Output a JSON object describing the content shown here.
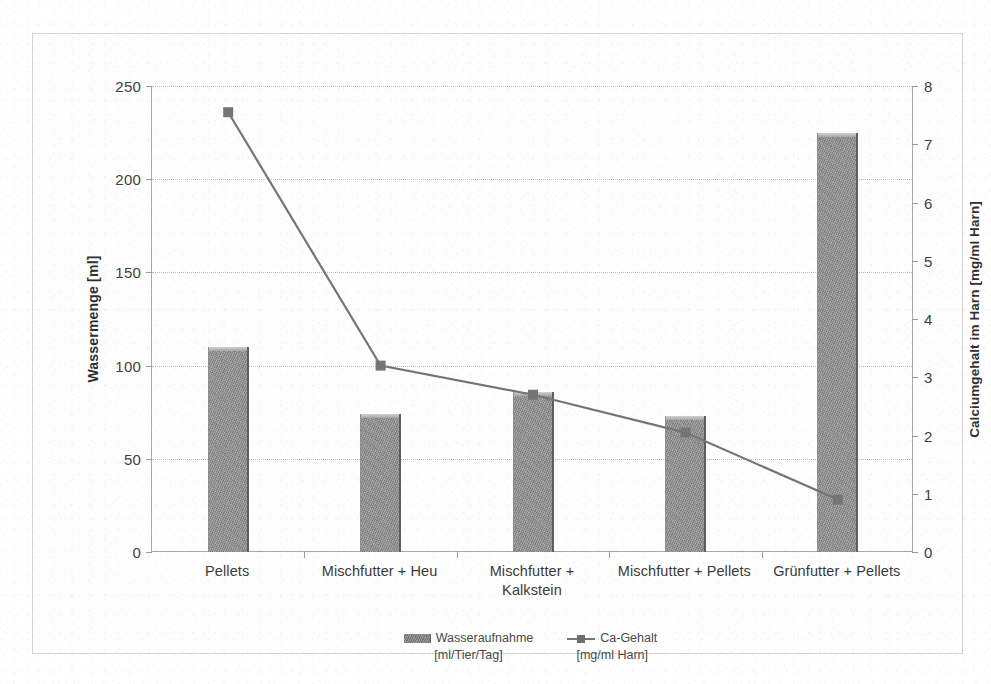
{
  "chart_data": {
    "type": "bar",
    "title": "",
    "subtitle": "",
    "xlabel": "",
    "categories": [
      "Pellets",
      "Mischfutter + Heu",
      "Mischfutter + Kalkstein",
      "Mischfutter + Pellets",
      "Grünfutter + Pellets"
    ],
    "category_lines": [
      [
        "Pellets"
      ],
      [
        "Mischfutter + Heu"
      ],
      [
        "Mischfutter +",
        "Kalkstein"
      ],
      [
        "Mischfutter + Pellets"
      ],
      [
        "Grünfutter + Pellets"
      ]
    ],
    "series": [
      {
        "name": "Wasseraufnahme",
        "unit": "[ml/Tier/Tag]",
        "type": "bar",
        "axis": "left",
        "values": [
          110,
          74,
          86,
          73,
          225
        ],
        "color": "#8b8b8b"
      },
      {
        "name": "Ca-Gehalt",
        "unit": "[mg/ml Harn]",
        "type": "line",
        "axis": "right",
        "values": [
          7.55,
          3.2,
          2.7,
          2.05,
          0.9
        ],
        "color": "#757575"
      }
    ],
    "ylabel": "Wassermenge [ml]",
    "ylim": [
      0,
      250
    ],
    "yticks": [
      0,
      50,
      100,
      150,
      200,
      250
    ],
    "y2label": "Calciumgehalt im Harn [mg/ml Harn]",
    "y2lim": [
      0,
      8
    ],
    "y2ticks": [
      0,
      1,
      2,
      3,
      4,
      5,
      6,
      7,
      8
    ],
    "grid": true,
    "legend_position": "bottom"
  },
  "axes": {
    "left": {
      "title": "Wassermenge [ml]",
      "ticks": [
        "250",
        "200",
        "150",
        "100",
        "50",
        "0"
      ]
    },
    "right": {
      "title": "Calciumgehalt im Harn [mg/ml Harn]",
      "ticks": [
        "8",
        "7",
        "6",
        "5",
        "4",
        "3",
        "2",
        "1",
        "0"
      ]
    }
  },
  "legend": {
    "items": [
      {
        "label": "Wasseraufnahme",
        "sub": "[ml/Tier/Tag]",
        "marker": "bar-swatch-icon"
      },
      {
        "label": "Ca-Gehalt",
        "sub": "[mg/ml Harn]",
        "marker": "line-marker-icon"
      }
    ]
  }
}
